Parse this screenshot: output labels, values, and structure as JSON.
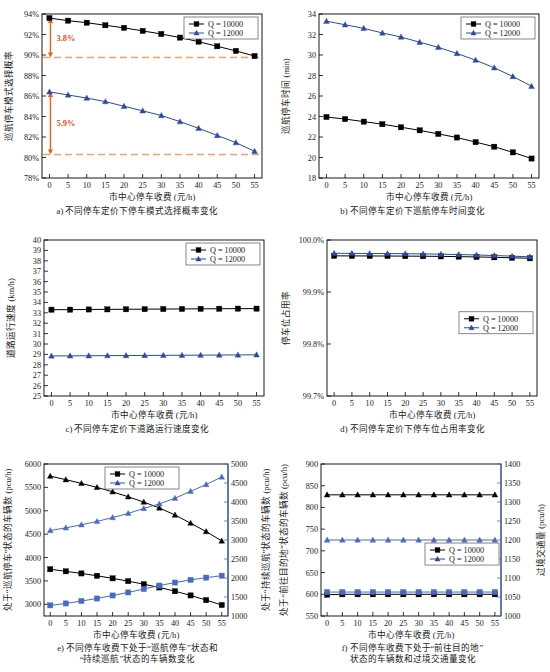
{
  "figure": {
    "xlabel_common": "市中心停车收费 (元/h)",
    "legend": {
      "s1": "Q = 10000",
      "s2": "Q = 12000"
    },
    "colors": {
      "series1": "#000000",
      "series2": "#2e4a9e",
      "right_axis": "#4a6ac0",
      "annotation": "#e8601c",
      "dashed": "#f5a06a"
    }
  },
  "chart_data": [
    {
      "id": "a",
      "type": "line",
      "title": "a) 不同停车定价下停车模式选择概率变化",
      "xlabel": "市中心停车收费 (元/h)",
      "ylabel": "巡航停车模式选择概率",
      "x": [
        0,
        5,
        10,
        15,
        20,
        25,
        30,
        35,
        40,
        45,
        50,
        55
      ],
      "xticks": [
        "0",
        "5",
        "10",
        "15",
        "20",
        "25",
        "30",
        "35",
        "40",
        "45",
        "50",
        "55"
      ],
      "yticks": [
        "78%",
        "80%",
        "82%",
        "84%",
        "86%",
        "88%",
        "90%",
        "92%",
        "94%"
      ],
      "ylim": [
        78,
        94
      ],
      "xlim": [
        -2,
        57
      ],
      "series": [
        {
          "name": "Q = 10000",
          "marker": "square",
          "color": "#000000",
          "values": [
            93.6,
            93.35,
            93.15,
            92.9,
            92.65,
            92.35,
            92.05,
            91.7,
            91.3,
            90.85,
            90.4,
            89.9
          ]
        },
        {
          "name": "Q = 12000",
          "marker": "triangle",
          "color": "#2e4a9e",
          "values": [
            86.4,
            86.1,
            85.8,
            85.45,
            85.0,
            84.55,
            84.1,
            83.5,
            82.85,
            82.15,
            81.45,
            80.6
          ]
        }
      ],
      "annotations": [
        {
          "label": "3.8%",
          "y_top": 93.6,
          "y_bottom": 89.75,
          "x": 0
        },
        {
          "label": "5.9%",
          "y_top": 86.4,
          "y_bottom": 80.3,
          "x": 0
        }
      ],
      "reference_lines": [
        89.75,
        80.3
      ],
      "legend_position": "top-right"
    },
    {
      "id": "b",
      "type": "line",
      "title": "b) 不同停车定价下巡航停车时间变化",
      "xlabel": "市中心停车收费 (元/h)",
      "ylabel": "巡航停车时间 (min)",
      "x": [
        0,
        5,
        10,
        15,
        20,
        25,
        30,
        35,
        40,
        45,
        50,
        55
      ],
      "xticks": [
        "0",
        "5",
        "10",
        "15",
        "20",
        "25",
        "30",
        "35",
        "40",
        "45",
        "50",
        "55"
      ],
      "yticks": [
        "18",
        "20",
        "22",
        "24",
        "26",
        "28",
        "30",
        "32",
        "34"
      ],
      "ylim": [
        18,
        34
      ],
      "xlim": [
        -2,
        57
      ],
      "series": [
        {
          "name": "Q = 10000",
          "marker": "square",
          "color": "#000000",
          "values": [
            23.95,
            23.75,
            23.5,
            23.25,
            22.95,
            22.65,
            22.3,
            21.95,
            21.5,
            21.05,
            20.5,
            19.9
          ]
        },
        {
          "name": "Q = 12000",
          "marker": "triangle",
          "color": "#2e4a9e",
          "values": [
            33.3,
            32.95,
            32.6,
            32.15,
            31.75,
            31.25,
            30.75,
            30.15,
            29.5,
            28.75,
            27.9,
            26.95
          ]
        }
      ],
      "legend_position": "top-right"
    },
    {
      "id": "c",
      "type": "line",
      "title": "c) 不同停车定价下道路运行速度变化",
      "xlabel": "市中心停车收费 (元/h)",
      "ylabel": "道路运行速度 (km/h)",
      "x": [
        0,
        5,
        10,
        15,
        20,
        25,
        30,
        35,
        40,
        45,
        50,
        55
      ],
      "xticks": [
        "0",
        "5",
        "10",
        "15",
        "20",
        "25",
        "30",
        "35",
        "40",
        "45",
        "50",
        "55"
      ],
      "yticks": [
        "25",
        "26",
        "27",
        "28",
        "29",
        "30",
        "31",
        "32",
        "33",
        "34",
        "35",
        "36",
        "37",
        "38",
        "39",
        "40"
      ],
      "ylim": [
        25,
        40
      ],
      "xlim": [
        -2,
        57
      ],
      "series": [
        {
          "name": "Q = 10000",
          "marker": "square",
          "color": "#000000",
          "values": [
            33.3,
            33.3,
            33.32,
            33.33,
            33.34,
            33.35,
            33.36,
            33.37,
            33.38,
            33.39,
            33.4,
            33.4
          ]
        },
        {
          "name": "Q = 12000",
          "marker": "triangle",
          "color": "#2e4a9e",
          "values": [
            28.85,
            28.86,
            28.87,
            28.88,
            28.89,
            28.9,
            28.91,
            28.92,
            28.93,
            28.94,
            28.95,
            28.96
          ]
        }
      ],
      "legend_position": "top-right"
    },
    {
      "id": "d",
      "type": "line",
      "title": "d) 不同停车定价下停车位占用率变化",
      "xlabel": "市中心停车收费 (元/h)",
      "ylabel": "停车位占用率",
      "x": [
        0,
        5,
        10,
        15,
        20,
        25,
        30,
        35,
        40,
        45,
        50,
        55
      ],
      "xticks": [
        "0",
        "5",
        "10",
        "15",
        "20",
        "25",
        "30",
        "35",
        "40",
        "45",
        "50",
        "55"
      ],
      "yticks": [
        "99.7%",
        "99.8%",
        "99.9%",
        "100.0%"
      ],
      "ylim": [
        99.7,
        100.0
      ],
      "xlim": [
        -2,
        57
      ],
      "series": [
        {
          "name": "Q = 10000",
          "marker": "square",
          "color": "#000000",
          "values": [
            99.9695,
            99.9694,
            99.9693,
            99.9692,
            99.969,
            99.9688,
            99.9685,
            99.968,
            99.9674,
            99.9667,
            99.9658,
            99.9648
          ]
        },
        {
          "name": "Q = 12000",
          "marker": "triangle",
          "color": "#2e4a9e",
          "values": [
            99.9745,
            99.9743,
            99.9741,
            99.9739,
            99.9736,
            99.9732,
            99.9727,
            99.972,
            99.9712,
            99.9702,
            99.969,
            99.9676
          ]
        }
      ],
      "legend_position": "middle-right"
    },
    {
      "id": "e",
      "type": "line",
      "title_lines": [
        "e) 不同停车收费下处于“巡航停车”状态和",
        "“持续巡航”状态的车辆数变化"
      ],
      "xlabel": "市中心停车收费 (元/h)",
      "ylabel_left": "处于“巡航停车”状态的车辆数 (pcu/h)",
      "ylabel_right": "处于“持续巡航”状态的车辆数 (pcu/h)",
      "x": [
        0,
        5,
        10,
        15,
        20,
        25,
        30,
        35,
        40,
        45,
        50,
        55
      ],
      "xticks": [
        "0",
        "5",
        "10",
        "15",
        "20",
        "25",
        "30",
        "35",
        "40",
        "45",
        "50",
        "55"
      ],
      "yticks_left": [
        "3000",
        "3500",
        "4000",
        "4500",
        "5000",
        "5500",
        "6000"
      ],
      "yticks_right": [
        "1000",
        "1500",
        "2000",
        "2500",
        "3000",
        "3500",
        "4000",
        "4500",
        "5000"
      ],
      "ylim_left": [
        2750,
        6000
      ],
      "ylim_right": [
        1000,
        5000
      ],
      "xlim": [
        -2,
        57
      ],
      "series": [
        {
          "name": "Q = 10000 (巡航停车)",
          "axis": "left",
          "marker": "square",
          "color": "#000000",
          "values": [
            3750,
            3705,
            3660,
            3610,
            3555,
            3495,
            3430,
            3360,
            3280,
            3190,
            3090,
            2985
          ]
        },
        {
          "name": "Q = 12000 (巡航停车)",
          "axis": "left",
          "marker": "triangle",
          "color": "#000000",
          "values": [
            5740,
            5665,
            5585,
            5500,
            5405,
            5300,
            5185,
            5060,
            4910,
            4735,
            4555,
            4355
          ]
        },
        {
          "name": "Q = 10000 (持续巡航)",
          "axis": "right",
          "marker": "square",
          "color": "#4a6ac0",
          "values": [
            1280,
            1330,
            1395,
            1460,
            1540,
            1620,
            1710,
            1800,
            1880,
            1950,
            2010,
            2060
          ]
        },
        {
          "name": "Q = 12000 (持续巡航)",
          "axis": "right",
          "marker": "triangle",
          "color": "#4a6ac0",
          "values": [
            3250,
            3320,
            3400,
            3490,
            3590,
            3700,
            3830,
            3950,
            4100,
            4280,
            4460,
            4660
          ]
        }
      ],
      "legend_position": "top-center"
    },
    {
      "id": "f",
      "type": "line",
      "title_lines": [
        "f) 不同停车收费下处于“前往目的地”",
        "状态的车辆数和过境交通量变化"
      ],
      "xlabel": "市中心停车收费 (元/h)",
      "ylabel_left": "处于“前往目的地”状态的车辆数 (pcu/h)",
      "ylabel_right": "过境交通量 (pcu/h)",
      "x": [
        0,
        5,
        10,
        15,
        20,
        25,
        30,
        35,
        40,
        45,
        50,
        55
      ],
      "xticks": [
        "0",
        "5",
        "10",
        "15",
        "20",
        "25",
        "30",
        "35",
        "40",
        "45",
        "50",
        "55"
      ],
      "yticks_left": [
        "550",
        "600",
        "650",
        "700",
        "750",
        "800",
        "850",
        "900"
      ],
      "yticks_right": [
        "1000",
        "1050",
        "1100",
        "1150",
        "1200",
        "1250",
        "1300",
        "1350",
        "1400"
      ],
      "ylim_left": [
        550,
        900
      ],
      "ylim_right": [
        1000,
        1400
      ],
      "xlim": [
        -2,
        57
      ],
      "series": [
        {
          "name": "Q = 10000 (前往目的地)",
          "axis": "left",
          "marker": "square",
          "color": "#000000",
          "values": [
            599,
            600,
            600,
            600,
            600,
            600,
            600,
            600,
            600,
            600,
            600,
            600
          ]
        },
        {
          "name": "Q = 12000 (前往目的地)",
          "axis": "left",
          "marker": "triangle",
          "color": "#000000",
          "values": [
            829,
            829,
            829,
            829,
            829,
            829,
            829,
            829,
            829,
            829,
            829,
            829
          ]
        },
        {
          "name": "Q = 10000 (过境交通量)",
          "axis": "right",
          "marker": "square",
          "color": "#4a6ac0",
          "values": [
            1063,
            1063,
            1063,
            1063,
            1063,
            1063,
            1063,
            1063,
            1063,
            1063,
            1063,
            1063
          ]
        },
        {
          "name": "Q = 12000 (过境交通量)",
          "axis": "right",
          "marker": "triangle",
          "color": "#4a6ac0",
          "values": [
            1200,
            1200,
            1200,
            1200,
            1200,
            1200,
            1200,
            1200,
            1200,
            1200,
            1200,
            1200
          ]
        }
      ],
      "legend_position": "middle-right"
    }
  ]
}
